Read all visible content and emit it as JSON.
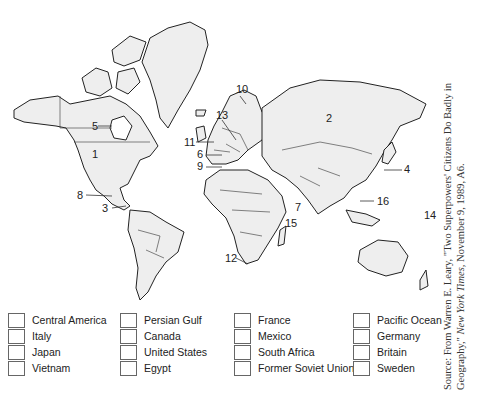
{
  "map": {
    "numbers": [
      {
        "n": "1",
        "x": 95,
        "y": 155
      },
      {
        "n": "2",
        "x": 328,
        "y": 118
      },
      {
        "n": "3",
        "x": 104,
        "y": 204
      },
      {
        "n": "4",
        "x": 405,
        "y": 167
      },
      {
        "n": "5",
        "x": 92,
        "y": 123
      },
      {
        "n": "6",
        "x": 198,
        "y": 151
      },
      {
        "n": "7",
        "x": 297,
        "y": 206
      },
      {
        "n": "8",
        "x": 78,
        "y": 191
      },
      {
        "n": "9",
        "x": 198,
        "y": 163
      },
      {
        "n": "10",
        "x": 236,
        "y": 84
      },
      {
        "n": "11",
        "x": 184,
        "y": 138
      },
      {
        "n": "12",
        "x": 225,
        "y": 255
      },
      {
        "n": "13",
        "x": 216,
        "y": 108
      },
      {
        "n": "14",
        "x": 424,
        "y": 210
      },
      {
        "n": "15",
        "x": 285,
        "y": 220
      },
      {
        "n": "16",
        "x": 376,
        "y": 197
      }
    ]
  },
  "answer_options": [
    [
      "Central America",
      "Italy",
      "Japan",
      "Vietnam"
    ],
    [
      "Persian Gulf",
      "Canada",
      "United States",
      "Egypt"
    ],
    [
      "France",
      "Mexico",
      "South Africa",
      "Former Soviet Union"
    ],
    [
      "Pacific Ocean",
      "Germany",
      "Britain",
      "Sweden"
    ]
  ],
  "source": {
    "line1": "Source: From Warren E. Leary, \"Two Superpowers' Citizens Do Badly in",
    "line2_pre": "Geography,\" ",
    "line2_italic": "New York Times,",
    "line2_post": " November 9, 1989, A6."
  }
}
